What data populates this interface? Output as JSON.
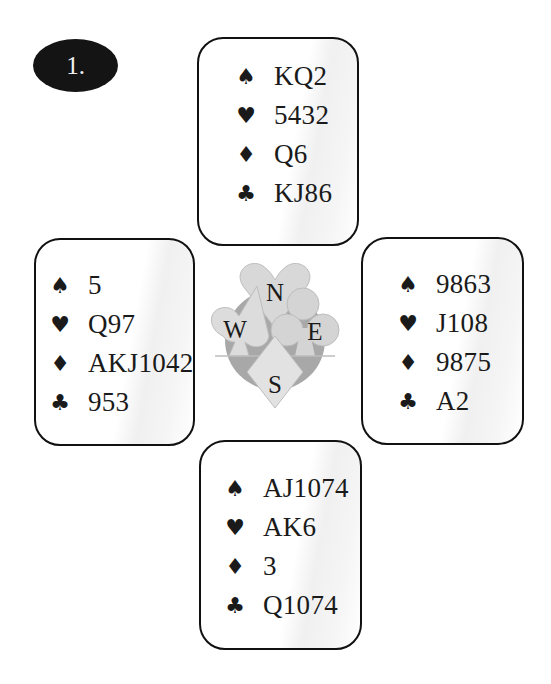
{
  "board": {
    "number_label": "1."
  },
  "compass": {
    "north": "N",
    "west": "W",
    "east": "E",
    "south": "S"
  },
  "suits": {
    "spades": "♠",
    "hearts": "♥",
    "diamonds": "♦",
    "clubs": "♣"
  },
  "hands": {
    "north": {
      "spades": "KQ2",
      "hearts": "5432",
      "diamonds": "Q6",
      "clubs": "KJ86"
    },
    "west": {
      "spades": "5",
      "hearts": "Q97",
      "diamonds": "AKJ1042",
      "clubs": "953"
    },
    "east": {
      "spades": "9863",
      "hearts": "J108",
      "diamonds": "9875",
      "clubs": "A2"
    },
    "south": {
      "spades": "AJ1074",
      "hearts": "AK6",
      "diamonds": "3",
      "clubs": "Q1074"
    }
  },
  "colors": {
    "badge_bg": "#141414",
    "badge_text": "#f2f2f2",
    "border": "#111111",
    "compass_gray_dark": "#9a9a9a",
    "compass_gray_light": "#d6d6d6"
  }
}
